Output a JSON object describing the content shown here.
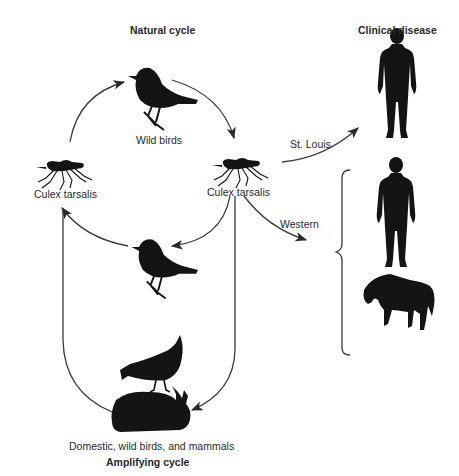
{
  "headings": {
    "natural_cycle": "Natural cycle",
    "clinical_disease": "Clinical disease",
    "amplifying_cycle": "Amplifying cycle"
  },
  "nodes": {
    "wild_birds": "Wild birds",
    "mosquito_left": "Culex tarsalis",
    "mosquito_right": "Culex tarsalis",
    "hosts": "Domestic, wild birds, and mammals"
  },
  "edges": {
    "st_louis": "St. Louis",
    "western": "Western"
  },
  "icons": {
    "wild_bird": "bird-silhouette-icon",
    "mosquito": "mosquito-silhouette-icon",
    "bird_small": "bird-silhouette-icon",
    "chicken": "chicken-silhouette-icon",
    "rabbit": "rabbit-silhouette-icon",
    "human": "human-silhouette-icon",
    "horse": "horse-silhouette-icon"
  },
  "colors": {
    "silhouette": "#141414",
    "line": "#3a3a3a",
    "text": "#2a2a2a",
    "background": "#ffffff"
  }
}
